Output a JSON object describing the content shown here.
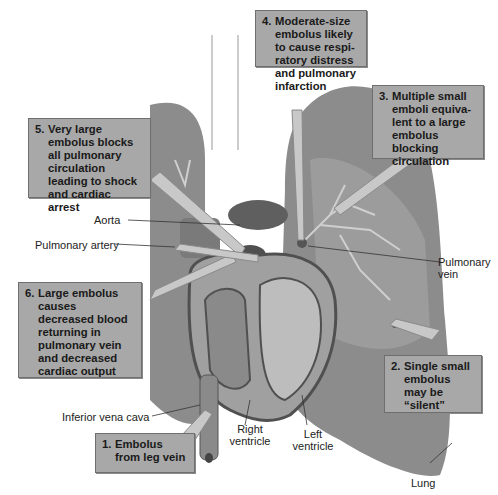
{
  "diagram": {
    "callouts": [
      {
        "id": "1",
        "number": "1.",
        "text": "Embolus from leg vein"
      },
      {
        "id": "2",
        "number": "2.",
        "text": "Single small embolus may be “silent”"
      },
      {
        "id": "3",
        "number": "3.",
        "text": "Multiple small emboli equiva-lent to a large embolus blocking circulation"
      },
      {
        "id": "4",
        "number": "4.",
        "text": "Moderate-size embolus likely to cause respi-ratory distress and pulmonary infarction"
      },
      {
        "id": "5",
        "number": "5.",
        "text": "Very large embolus blocks all pulmonary circulation leading to shock and cardiac arrest"
      },
      {
        "id": "6",
        "number": "6.",
        "text": "Large embolus causes decreased blood returning in pulmonary vein and decreased cardiac output"
      }
    ],
    "labels": {
      "aorta": "Aorta",
      "pulmonary_artery": "Pulmonary artery",
      "pulmonary_vein": "Pulmonary vein",
      "inferior_vena_cava": "Inferior vena cava",
      "right_ventricle": "Right ventricle",
      "left_ventricle": "Left ventricle",
      "lung": "Lung"
    },
    "colors": {
      "box_fill": "#a8a8a8",
      "lung_fill": "#8c8c8c",
      "lung_light": "#b5b5b5",
      "heart_dark": "#5a5a5a",
      "arrow_fill": "#c8c8c8"
    }
  }
}
